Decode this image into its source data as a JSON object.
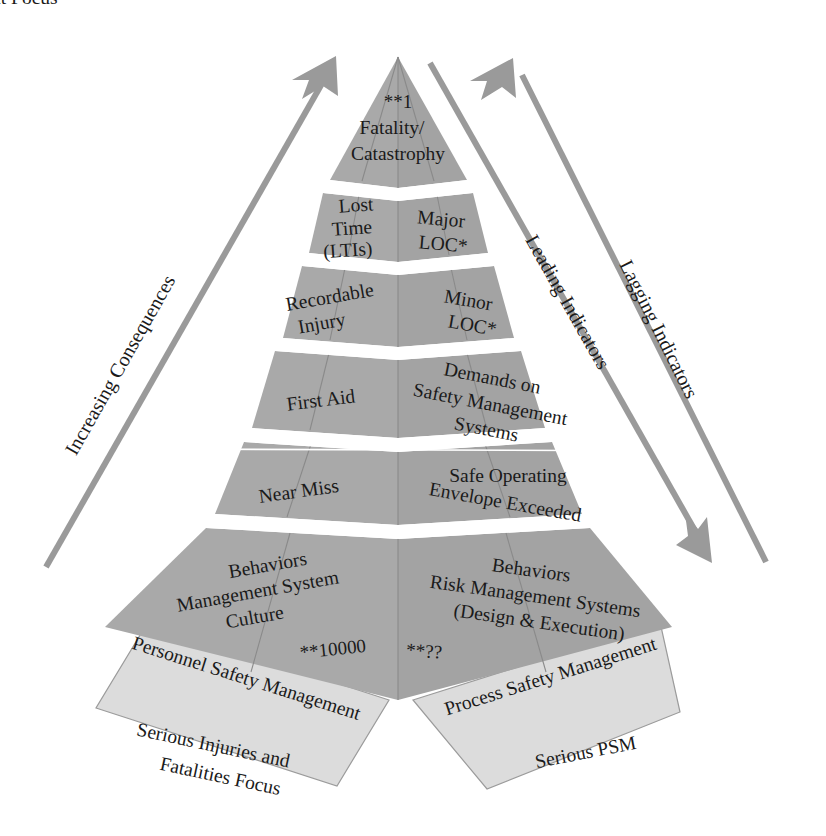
{
  "figure": {
    "type": "pyramid-diagram",
    "colors": {
      "pyramid_fill": "#a9a9a9",
      "pyramid_fill_dark": "#9a9a9a",
      "flange_fill": "#dcdcdc",
      "arrow": "#9a9a9a",
      "text": "#1a1a1a",
      "background": "#ffffff",
      "gap_band": "#ffffff"
    }
  },
  "apex": {
    "count": "**1",
    "line1": "Fatality/",
    "line2": "Catastrophy"
  },
  "tiers": [
    {
      "index": 1,
      "left": {
        "lines": [
          "Fatality/",
          "Catastrophy"
        ],
        "count": "**1"
      },
      "right": {
        "lines": []
      }
    },
    {
      "index": 2,
      "left": {
        "lines": [
          "Lost",
          "Time",
          "(LTIs)"
        ]
      },
      "right": {
        "lines": [
          "Major",
          "LOC*"
        ]
      }
    },
    {
      "index": 3,
      "left": {
        "lines": [
          "Recordable",
          "Injury"
        ]
      },
      "right": {
        "lines": [
          "Minor",
          "LOC*"
        ]
      }
    },
    {
      "index": 4,
      "left": {
        "lines": [
          "First Aid"
        ]
      },
      "right": {
        "lines": [
          "Demands on",
          "Safety Management",
          "Systems"
        ]
      }
    },
    {
      "index": 5,
      "left": {
        "lines": [
          "Near Miss"
        ]
      },
      "right": {
        "lines": [
          "Safe Operating",
          "Envelope Exceeded"
        ]
      }
    },
    {
      "index": 6,
      "left": {
        "lines": [
          "Behaviors",
          "Management System",
          "Culture"
        ],
        "count": "**10000"
      },
      "right": {
        "lines": [
          "Behaviors",
          "Risk Management Systems",
          "(Design & Execution)"
        ],
        "count": "**??"
      }
    }
  ],
  "axes": [
    {
      "id": "increasing-consequences",
      "label": "Increasing Consequences",
      "side": "left",
      "arrowhead": "top"
    },
    {
      "id": "leading-indicators",
      "label": "Leading Indicators",
      "side": "right-inner",
      "arrowhead": "bottom"
    },
    {
      "id": "lagging-indicators",
      "label": "Lagging Indicators",
      "side": "right-outer",
      "arrowhead": "top"
    }
  ],
  "flanges": [
    {
      "id": "personnel-safety-management",
      "label": "Personnel Safety Management",
      "focus": [
        "Serious Injuries and",
        "Fatalities Focus"
      ],
      "side": "left"
    },
    {
      "id": "process-safety-management",
      "label": "Process Safety Management",
      "focus": [
        "Serious PSM",
        "Incident Focus"
      ],
      "side": "right"
    }
  ]
}
